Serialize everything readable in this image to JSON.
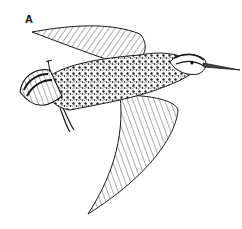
{
  "figure": {
    "label": "A",
    "style": "black-and-white pen drawing",
    "colors": {
      "ink": "#1a1a1a",
      "paper": "#ffffff"
    }
  }
}
